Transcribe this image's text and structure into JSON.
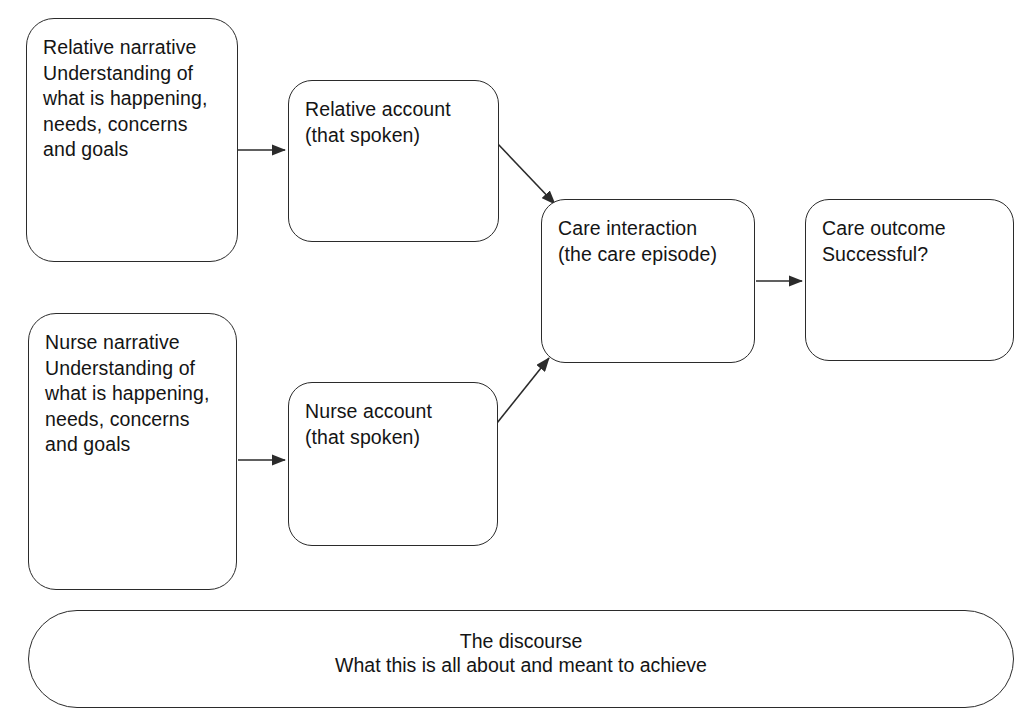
{
  "diagram": {
    "stroke_color": "#2b2b2b",
    "text_color": "#141414",
    "background_color": "#ffffff",
    "nodes": {
      "relative_narrative": {
        "label": "Relative narrative\nUnderstanding of\nwhat is happening,\nneeds, concerns\nand goals"
      },
      "relative_account": {
        "label": "Relative account\n(that spoken)"
      },
      "nurse_narrative": {
        "label": "Nurse narrative\nUnderstanding of\nwhat is happening,\nneeds, concerns\nand goals"
      },
      "nurse_account": {
        "label": "Nurse account\n(that spoken)"
      },
      "care_interaction": {
        "label": "Care interaction\n(the care episode)"
      },
      "care_outcome": {
        "label": "Care outcome\nSuccessful?"
      },
      "discourse_bar": {
        "line_1": "The discourse",
        "line_2": "What this is all about and meant to achieve"
      }
    },
    "edges": [
      {
        "id": "relative-narrative-to-relative-account",
        "from": "relative_narrative",
        "to": "relative_account",
        "style": "straight-horizontal-arrow"
      },
      {
        "id": "relative-account-to-care-interaction",
        "from": "relative_account",
        "to": "care_interaction",
        "style": "diagonal-down-arrow"
      },
      {
        "id": "nurse-narrative-to-nurse-account",
        "from": "nurse_narrative",
        "to": "nurse_account",
        "style": "straight-horizontal-arrow"
      },
      {
        "id": "nurse-account-to-care-interaction",
        "from": "nurse_account",
        "to": "care_interaction",
        "style": "diagonal-up-arrow"
      },
      {
        "id": "care-interaction-to-care-outcome",
        "from": "care_interaction",
        "to": "care_outcome",
        "style": "straight-horizontal-arrow"
      },
      {
        "id": "discourse-arrow-left",
        "from": "discourse_bar",
        "to": "discourse_bar",
        "style": "straight-horizontal-arrow"
      },
      {
        "id": "discourse-arrow-right",
        "from": "discourse_bar",
        "to": "discourse_bar",
        "style": "straight-horizontal-arrow"
      }
    ]
  }
}
